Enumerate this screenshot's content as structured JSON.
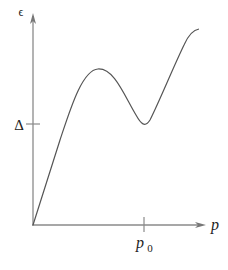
{
  "diagram": {
    "type": "dispersion-curve",
    "y_axis": {
      "label": "ϵ",
      "tick_label": "Δ"
    },
    "x_axis": {
      "label": "p",
      "tick_label": "p",
      "tick_subscript": "0"
    },
    "colors": {
      "axis": "#8a8a8a",
      "curve": "#555555",
      "text": "#222222"
    },
    "curve": {
      "description": "Linear rise from origin, local maximum, local minimum at p0 with energy Δ, then rising again",
      "key_points": [
        {
          "name": "origin",
          "x": 33,
          "y": 225
        },
        {
          "name": "maximum",
          "x": 98,
          "y": 69
        },
        {
          "name": "minimum",
          "x": 144,
          "y": 125
        },
        {
          "name": "end",
          "x": 198,
          "y": 29
        }
      ]
    }
  }
}
